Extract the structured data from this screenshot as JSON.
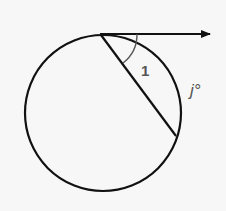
{
  "diagram": {
    "type": "circle-tangent-chord",
    "angle_label": "1",
    "arc_label": "j°",
    "colors": {
      "stroke": "#111111",
      "label": "#555555",
      "background": "#f7f7f7"
    }
  }
}
